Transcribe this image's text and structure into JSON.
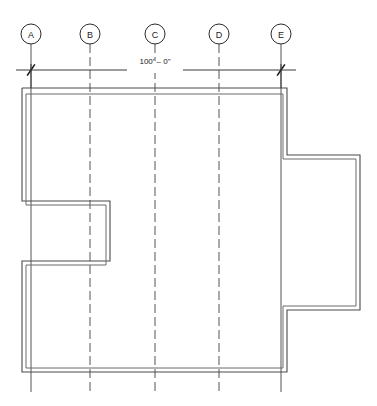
{
  "drawing": {
    "type": "architectural-floor-plan",
    "title": "Floor Plan with Column Grid",
    "canvas": {
      "width": 377,
      "height": 406
    },
    "background_color": "#ffffff",
    "line_color": "#4a4a4a",
    "grid_line_color": "#555555",
    "text_color": "#1a1a1a"
  },
  "grid": {
    "bubble_radius": 10,
    "bubble_center_y": 34,
    "line_top_y": 44,
    "line_bottom_y": 392,
    "columns": [
      {
        "label": "A",
        "x": 31
      },
      {
        "label": "B",
        "x": 90
      },
      {
        "label": "C",
        "x": 155
      },
      {
        "label": "D",
        "x": 219
      },
      {
        "label": "E",
        "x": 281
      }
    ]
  },
  "dimension": {
    "label": "100' – 0\"",
    "label_x": 155,
    "label_y": 64,
    "line_y": 70,
    "line_x1": 16,
    "line_x2": 296,
    "start_x": 31,
    "end_x": 281,
    "tick_size": 7,
    "extension_top_y": 64,
    "extension_bottom_y": 88
  },
  "building": {
    "outer_outline_points": "22,88 287,88 287,155 360,155 360,310 287,310 287,372 22,372 22,261 110,261 110,201 22,201 22,88",
    "inner_outline_points": "26,94 283,94 283,159 356,159 356,306 283,306 283,368 26,368 26,265 106,265 106,205 26,205 26,94",
    "notch": {
      "name": "left-notch",
      "x_extent": 110,
      "y_top": 201,
      "y_bottom": 261
    },
    "protrusion": {
      "name": "right-bump-out",
      "x_extent": 360,
      "y_top": 155,
      "y_bottom": 310
    },
    "extents": {
      "left": 22,
      "right": 287,
      "top": 88,
      "bottom": 372
    }
  },
  "chart_data": {
    "type": "table",
    "categories": [
      "A",
      "B",
      "C",
      "D",
      "E"
    ],
    "values": [
      31,
      90,
      155,
      219,
      281
    ],
    "xlabel": "Grid Column",
    "ylabel": "Horizontal Position (px)",
    "annotations": [
      "100' – 0\""
    ]
  }
}
